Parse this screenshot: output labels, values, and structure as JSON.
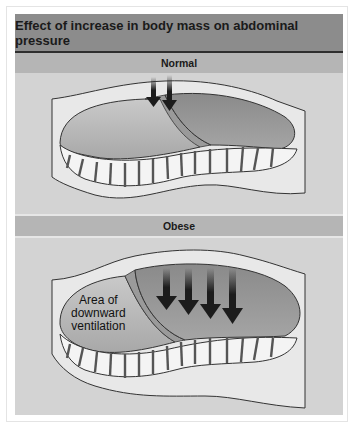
{
  "figure": {
    "title": "Effect of increase in body mass on abdominal pressure",
    "sections": [
      {
        "label": "Normal",
        "arrow_count": 2
      },
      {
        "label": "Obese",
        "arrow_count": 4,
        "annotation": [
          "Area of",
          "downward",
          "ventilation"
        ]
      }
    ]
  },
  "colors": {
    "title_bar": "#8c8c8c",
    "section_bar": "#b5b5b5",
    "panel_bg": "#d3d3d3",
    "abdomen_dark": "#8f8f8f",
    "lung_light": "#b0b0b0",
    "arrow": "#1c1c1c"
  }
}
